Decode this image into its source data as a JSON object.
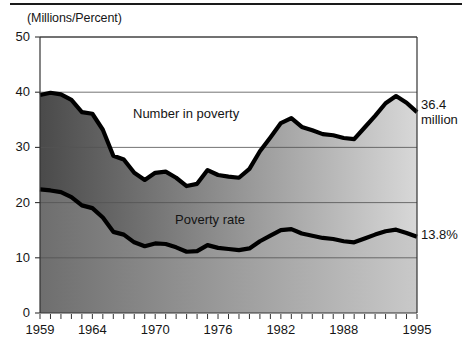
{
  "figure": {
    "units_label": "(Millions/Percent)",
    "series_labels": {
      "number": "Number in poverty",
      "rate": "Poverty rate"
    },
    "annotations": {
      "number_end_value": "36.4",
      "number_end_unit": "million",
      "rate_end_value": "13.8%"
    },
    "colors": {
      "line": "#000000",
      "axis": "#333333",
      "grid": "#555555",
      "fill_top_light": "#d8d8d8",
      "fill_top_dark": "#4a4a4a",
      "fill_bottom_light": "#c9c9c9",
      "fill_bottom_dark": "#6e6e6e",
      "background": "#ffffff"
    }
  },
  "chart_data": {
    "type": "area",
    "title": "",
    "subtitle": "",
    "xlabel": "",
    "ylabel": "(Millions/Percent)",
    "xlim": [
      1959,
      1995
    ],
    "ylim": [
      0,
      50
    ],
    "yticks": [
      0,
      10,
      20,
      30,
      40,
      50
    ],
    "ytick_labels": [
      "0",
      "10",
      "20",
      "30",
      "40",
      "50"
    ],
    "xticks": [
      1959,
      1964,
      1970,
      1976,
      1982,
      1988,
      1995
    ],
    "xtick_labels": [
      "1959",
      "1964",
      "1970",
      "1976",
      "1982",
      "1988",
      "1995"
    ],
    "xtick_minor_step": 1,
    "grid": true,
    "grid_axis": "y",
    "legend": "inline-labels",
    "x": [
      1959,
      1960,
      1961,
      1962,
      1963,
      1964,
      1965,
      1966,
      1967,
      1968,
      1969,
      1970,
      1971,
      1972,
      1973,
      1974,
      1975,
      1976,
      1977,
      1978,
      1979,
      1980,
      1981,
      1982,
      1983,
      1984,
      1985,
      1986,
      1987,
      1988,
      1989,
      1990,
      1991,
      1992,
      1993,
      1994,
      1995
    ],
    "series": [
      {
        "name": "Number in poverty",
        "unit": "millions",
        "end_label": "36.4 million",
        "values": [
          39.5,
          39.9,
          39.6,
          38.6,
          36.4,
          36.1,
          33.2,
          28.5,
          27.8,
          25.4,
          24.1,
          25.4,
          25.6,
          24.5,
          23.0,
          23.4,
          25.9,
          25.0,
          24.7,
          24.5,
          26.1,
          29.3,
          31.8,
          34.4,
          35.3,
          33.7,
          33.1,
          32.4,
          32.2,
          31.7,
          31.5,
          33.6,
          35.7,
          38.0,
          39.3,
          38.1,
          36.4
        ]
      },
      {
        "name": "Poverty rate",
        "unit": "percent",
        "end_label": "13.8%",
        "values": [
          22.4,
          22.2,
          21.9,
          21.0,
          19.5,
          19.0,
          17.3,
          14.7,
          14.2,
          12.8,
          12.1,
          12.6,
          12.5,
          11.9,
          11.1,
          11.2,
          12.3,
          11.8,
          11.6,
          11.4,
          11.7,
          13.0,
          14.0,
          15.0,
          15.2,
          14.4,
          14.0,
          13.6,
          13.4,
          13.0,
          12.8,
          13.5,
          14.2,
          14.8,
          15.1,
          14.5,
          13.8
        ]
      }
    ]
  }
}
